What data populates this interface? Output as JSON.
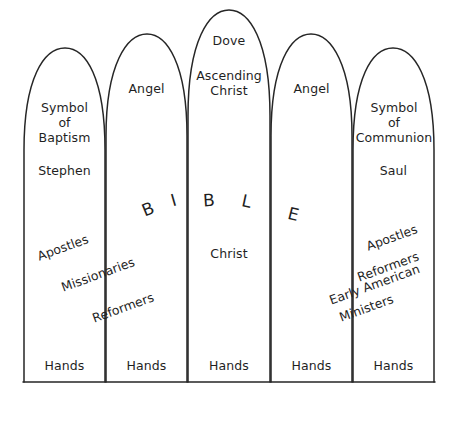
{
  "diagram": {
    "stroke_color": "#262626",
    "background_color": "#ffffff",
    "panels": [
      {
        "index": 1,
        "top_labels": [
          "Symbol",
          "of",
          "Baptism"
        ],
        "name_label": "Stephen",
        "bottom_label": "Hands"
      },
      {
        "index": 2,
        "top_labels": [
          "Angel"
        ],
        "name_label": "",
        "bottom_label": "Hands"
      },
      {
        "index": 3,
        "top_labels": [
          "Dove",
          "Ascending",
          "Christ"
        ],
        "name_label": "Christ",
        "bottom_label": "Hands"
      },
      {
        "index": 4,
        "top_labels": [
          "Angel"
        ],
        "name_label": "",
        "bottom_label": "Hands"
      },
      {
        "index": 5,
        "top_labels": [
          "Symbol",
          "of",
          "Communion"
        ],
        "name_label": "Saul",
        "bottom_label": "Hands"
      }
    ],
    "panel_1_text": {
      "symbol_line1": "Symbol",
      "symbol_line2": "of",
      "symbol_line3": "Baptism",
      "person": "Stephen",
      "hands": "Hands"
    },
    "panel_2_text": {
      "angel": "Angel",
      "hands": "Hands"
    },
    "panel_3_text": {
      "dove": "Dove",
      "ascending": "Ascending",
      "christ_top": "Christ",
      "christ_mid": "Christ",
      "hands": "Hands"
    },
    "panel_4_text": {
      "angel": "Angel",
      "hands": "Hands"
    },
    "panel_5_text": {
      "symbol_line1": "Symbol",
      "symbol_line2": "of",
      "symbol_line3": "Communion",
      "person": "Saul",
      "hands": "Hands"
    },
    "bible_letters": [
      "B",
      "I",
      "B",
      "L",
      "E"
    ],
    "left_diagonal_labels": [
      "Apostles",
      "Missionaries",
      "Reformers"
    ],
    "right_diagonal_labels": [
      "Apostles",
      "Reformers",
      "Early American",
      "Ministers"
    ],
    "right_diagonal_group_3_line1": "Early American",
    "right_diagonal_group_3_line2": "Ministers"
  }
}
